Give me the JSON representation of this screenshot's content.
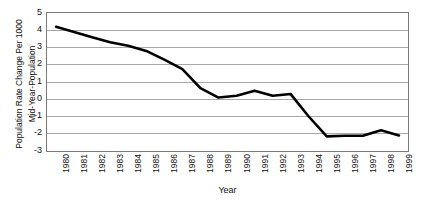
{
  "chart_data": {
    "type": "line",
    "title": "",
    "xlabel": "Year",
    "ylabel": "Population Rate Change Per 1000 Mid-Year-Population",
    "ylabel_lines": [
      "Population Rate Change Per 1000",
      "Mid-Year-Population"
    ],
    "categories": [
      "1980",
      "1981",
      "1982",
      "1983",
      "1984",
      "1985",
      "1986",
      "1987",
      "1988",
      "1989",
      "1990",
      "1991",
      "1992",
      "1993",
      "1994",
      "1995",
      "1996",
      "1997",
      "1998",
      "1999"
    ],
    "values": [
      4.2,
      3.9,
      3.6,
      3.3,
      3.1,
      2.8,
      2.3,
      1.75,
      0.65,
      0.1,
      0.2,
      0.5,
      0.2,
      0.3,
      -1.0,
      -2.15,
      -2.12,
      -2.12,
      -1.8,
      -2.1
    ],
    "series": [
      {
        "name": "Population Rate Change Per 1000 Mid-Year-Population",
        "values": [
          4.2,
          3.9,
          3.6,
          3.3,
          3.1,
          2.8,
          2.3,
          1.75,
          0.65,
          0.1,
          0.2,
          0.5,
          0.2,
          0.3,
          -1.0,
          -2.15,
          -2.12,
          -2.12,
          -1.8,
          -2.1
        ],
        "color": "#000000"
      }
    ],
    "ylim": [
      -3,
      5
    ],
    "yticks": [
      5,
      4,
      3,
      2,
      1,
      0,
      -1,
      -2,
      -3
    ],
    "ytick_labels": [
      "5",
      "4",
      "3",
      "2",
      "1",
      "0",
      "-1",
      "-2",
      "-3"
    ],
    "grid": true,
    "grid_axis": "y",
    "grid_color": "#a8a8a8",
    "legend": false,
    "line_width": 2.6,
    "markers": false,
    "frame_color": "#7a7a7a",
    "background": "#ffffff"
  }
}
